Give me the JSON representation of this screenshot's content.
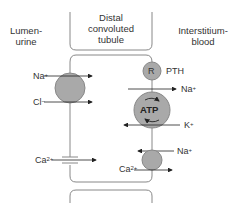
{
  "regions": {
    "lumen": "Lumen-\nurine",
    "tubule": "Distal\nconvoluted\ntubule",
    "interstitium": "Interstitium-\nblood"
  },
  "apical_transport": [
    {
      "ion": "Na",
      "charge": "+",
      "direction": "into-cell"
    },
    {
      "ion": "Cl",
      "charge": "−",
      "direction": "into-cell"
    },
    {
      "ion": "Ca",
      "charge": "2+",
      "direction": "into-cell",
      "via": "channel"
    }
  ],
  "basolateral_transport": [
    {
      "ion": "Na",
      "charge": "+",
      "direction": "out-to-blood",
      "via": "Na/K-ATPase"
    },
    {
      "ion": "K",
      "charge": "+",
      "direction": "into-cell",
      "via": "Na/K-ATPase"
    },
    {
      "ion": "Na",
      "charge": "+",
      "direction": "into-cell",
      "via": "Na/Ca exchanger"
    },
    {
      "ion": "Ca",
      "charge": "2+",
      "direction": "out-to-blood",
      "via": "Na/Ca exchanger"
    }
  ],
  "receptor": {
    "symbol": "R",
    "hormone": "PTH"
  },
  "pump": {
    "label": "ATP"
  },
  "labels": {
    "na": "Na",
    "cl": "Cl",
    "k": "K",
    "ca": "Ca",
    "plus": "+",
    "minus": "−",
    "twoplus": "2+",
    "r": "R",
    "pth": "PTH",
    "atp": "ATP"
  },
  "colors": {
    "line": "#888888",
    "fill": "#a9a9a9",
    "arrow": "#222222",
    "text": "#333333"
  }
}
